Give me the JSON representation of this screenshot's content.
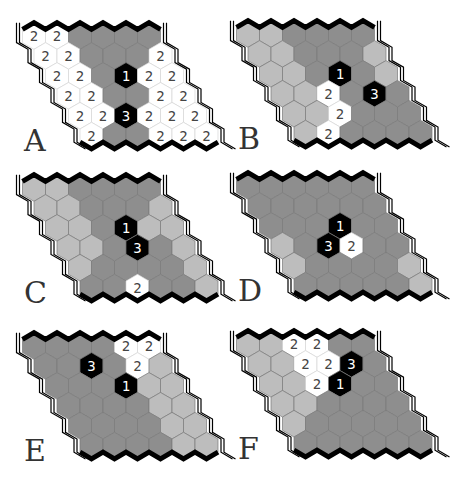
{
  "figure": {
    "colors": {
      "dark_gray": "#8e8e8e",
      "light_gray": "#bdbdbd",
      "white": "#ffffff",
      "black": "#000000",
      "cell_stroke": "#7a7a7a",
      "text_on_white": "#444444",
      "text_on_black": "#ffffff"
    },
    "legend_codes": {
      "G": "dark gray cell",
      "L": "light gray cell",
      "W2": "white cell labeled 2",
      "K1": "black cell labeled 1",
      "K3": "black cell labeled 3"
    },
    "boards": [
      {
        "label": "A",
        "rows": [
          [
            "W2",
            "W2",
            "G",
            "G",
            "G",
            "G"
          ],
          [
            "W2",
            "W2",
            "G",
            "G",
            "G",
            "W2"
          ],
          [
            "W2",
            "W2",
            "G",
            "K1",
            "W2",
            "W2"
          ],
          [
            "W2",
            "W2",
            "G",
            "G",
            "W2",
            "W2"
          ],
          [
            "W2",
            "W2",
            "K3",
            "W2",
            "W2",
            "W2"
          ],
          [
            "W2",
            "G",
            "G",
            "W2",
            "W2",
            "W2"
          ]
        ]
      },
      {
        "label": "B",
        "rows": [
          [
            "L",
            "L",
            "G",
            "G",
            "G",
            "G"
          ],
          [
            "L",
            "L",
            "G",
            "G",
            "G",
            "L"
          ],
          [
            "L",
            "L",
            "G",
            "K1",
            "G",
            "L"
          ],
          [
            "L",
            "L",
            "W2",
            "G",
            "K3",
            "G"
          ],
          [
            "L",
            "L",
            "W2",
            "G",
            "G",
            "G"
          ],
          [
            "L",
            "W2",
            "G",
            "G",
            "G",
            "G"
          ]
        ]
      },
      {
        "label": "C",
        "rows": [
          [
            "L",
            "L",
            "G",
            "G",
            "G",
            "G"
          ],
          [
            "L",
            "L",
            "G",
            "G",
            "G",
            "L"
          ],
          [
            "L",
            "L",
            "G",
            "K1",
            "L",
            "L"
          ],
          [
            "L",
            "L",
            "G",
            "K3",
            "G",
            "L"
          ],
          [
            "L",
            "G",
            "G",
            "G",
            "G",
            "L"
          ],
          [
            "G",
            "G",
            "W2",
            "G",
            "G",
            "L"
          ]
        ]
      },
      {
        "label": "D",
        "rows": [
          [
            "G",
            "G",
            "G",
            "G",
            "G",
            "G"
          ],
          [
            "G",
            "G",
            "G",
            "G",
            "G",
            "G"
          ],
          [
            "G",
            "G",
            "G",
            "K1",
            "G",
            "G"
          ],
          [
            "L",
            "G",
            "K3",
            "W2",
            "G",
            "G"
          ],
          [
            "L",
            "G",
            "G",
            "G",
            "G",
            "L"
          ],
          [
            "G",
            "G",
            "G",
            "G",
            "G",
            "L"
          ]
        ]
      },
      {
        "label": "E",
        "rows": [
          [
            "G",
            "G",
            "G",
            "G",
            "W2",
            "W2"
          ],
          [
            "G",
            "G",
            "K3",
            "G",
            "W2",
            "L"
          ],
          [
            "G",
            "G",
            "G",
            "K1",
            "L",
            "L"
          ],
          [
            "G",
            "G",
            "G",
            "G",
            "L",
            "L"
          ],
          [
            "G",
            "G",
            "G",
            "G",
            "L",
            "L"
          ],
          [
            "G",
            "G",
            "G",
            "G",
            "L",
            "L"
          ]
        ]
      },
      {
        "label": "F",
        "rows": [
          [
            "L",
            "L",
            "W2",
            "W2",
            "G",
            "G"
          ],
          [
            "L",
            "L",
            "W2",
            "W2",
            "K3",
            "G"
          ],
          [
            "L",
            "L",
            "W2",
            "K1",
            "G",
            "G"
          ],
          [
            "L",
            "L",
            "G",
            "G",
            "G",
            "G"
          ],
          [
            "L",
            "G",
            "G",
            "G",
            "G",
            "G"
          ],
          [
            "G",
            "G",
            "G",
            "G",
            "G",
            "G"
          ]
        ]
      }
    ]
  }
}
